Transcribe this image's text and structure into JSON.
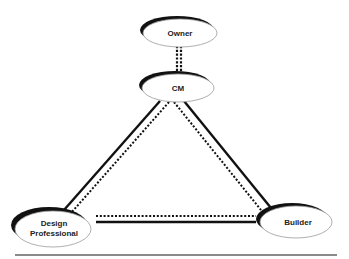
{
  "diagram": {
    "nodes": [
      {
        "id": "owner",
        "label_lines": [
          "Owner"
        ]
      },
      {
        "id": "cm",
        "label_lines": [
          "CM"
        ]
      },
      {
        "id": "design",
        "label_lines": [
          "Design",
          "Professional"
        ]
      },
      {
        "id": "builder",
        "label_lines": [
          "Builder"
        ]
      }
    ],
    "edges": [
      {
        "from": "owner",
        "to": "cm",
        "style": "dotted-double"
      },
      {
        "from": "cm",
        "to": "design",
        "style": "solid+dotted"
      },
      {
        "from": "cm",
        "to": "builder",
        "style": "solid+dotted"
      },
      {
        "from": "design",
        "to": "builder",
        "style": "solid+dotted"
      }
    ],
    "colors": {
      "stroke": "#111111",
      "shadow": "#111111",
      "fill": "#ffffff",
      "baseline": "#8a8a8a"
    }
  }
}
